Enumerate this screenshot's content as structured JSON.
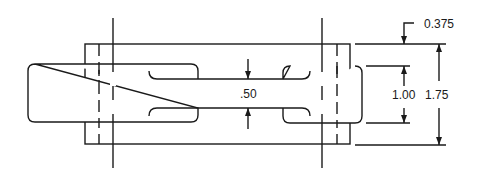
{
  "drawing": {
    "type": "dimensioned technical drawing",
    "colors": {
      "line": "#1a1a1a",
      "background": "#ffffff"
    },
    "dimensions": {
      "slot_width": ".50",
      "flange_offset": "0.375",
      "inner_height": "1.00",
      "overall_height": "1.75"
    }
  }
}
